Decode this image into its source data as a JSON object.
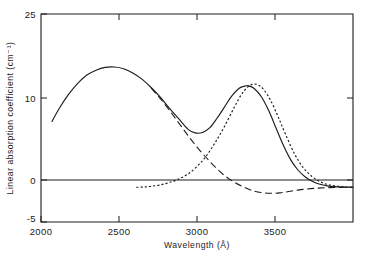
{
  "chart_data": {
    "type": "line",
    "title": "",
    "xlabel": "Wavelength (Å)",
    "ylabel": "Linear absorption coefficient  (cm⁻¹)",
    "xlim": [
      2000,
      3700
    ],
    "ylim": [
      -5,
      25
    ],
    "xticks": [
      2000,
      2500,
      3000,
      3500
    ],
    "xtick_labels": [
      "2000",
      "2500",
      "3000",
      "3500"
    ],
    "yticks": [
      -5,
      0,
      10,
      25
    ],
    "ytick_labels": [
      "-5",
      "0",
      "10",
      "25"
    ],
    "grid": false,
    "legend_position": "none",
    "zero_line": 0,
    "series": [
      {
        "name": "total absorption",
        "style": "solid",
        "x": [
          2060,
          2100,
          2150,
          2200,
          2250,
          2300,
          2350,
          2400,
          2450,
          2500,
          2550,
          2600,
          2650,
          2700,
          2750,
          2800,
          2840,
          2880,
          2920,
          2960,
          3000,
          3040,
          3080,
          3110,
          3130,
          3160,
          3200,
          3240,
          3280,
          3320,
          3360,
          3400,
          3440,
          3480,
          3520,
          3560,
          3600,
          3650,
          3700
        ],
        "y": [
          9.5,
          11.4,
          13.4,
          15.0,
          16.2,
          16.9,
          17.3,
          17.35,
          17.1,
          16.5,
          15.6,
          14.4,
          13.0,
          11.4,
          9.9,
          8.4,
          7.85,
          7.9,
          8.6,
          10.0,
          11.6,
          13.2,
          14.3,
          14.6,
          14.65,
          14.3,
          13.1,
          11.1,
          8.6,
          6.1,
          4.0,
          2.5,
          1.5,
          0.85,
          0.45,
          0.22,
          0.1,
          0.04,
          0.0
        ]
      },
      {
        "name": "component 1 (long-dash)",
        "style": "dashed",
        "x": [
          2600,
          2650,
          2700,
          2750,
          2800,
          2850,
          2900,
          2950,
          3000,
          3050,
          3100,
          3150,
          3200,
          3250,
          3300,
          3350,
          3400,
          3450,
          3500,
          3550,
          3600,
          3650,
          3700
        ],
        "y": [
          14.3,
          12.8,
          11.1,
          9.3,
          7.5,
          5.8,
          4.3,
          2.9,
          1.7,
          0.8,
          0.1,
          -0.45,
          -0.75,
          -0.85,
          -0.8,
          -0.6,
          -0.4,
          -0.24,
          -0.13,
          -0.06,
          -0.02,
          0.0,
          0.0
        ]
      },
      {
        "name": "component 2 (dotted)",
        "style": "dotted",
        "x": [
          2520,
          2560,
          2600,
          2650,
          2700,
          2750,
          2800,
          2850,
          2900,
          2950,
          3000,
          3050,
          3090,
          3120,
          3150,
          3180,
          3210,
          3250,
          3290,
          3330,
          3380,
          3430,
          3480,
          3530,
          3580,
          3640,
          3700
        ],
        "y": [
          0.0,
          0.05,
          0.15,
          0.35,
          0.7,
          1.2,
          1.9,
          3.0,
          4.5,
          6.5,
          8.8,
          11.4,
          13.3,
          14.3,
          14.85,
          14.8,
          14.2,
          12.6,
          10.3,
          7.8,
          4.9,
          2.8,
          1.5,
          0.7,
          0.3,
          0.1,
          0.0
        ]
      }
    ]
  }
}
